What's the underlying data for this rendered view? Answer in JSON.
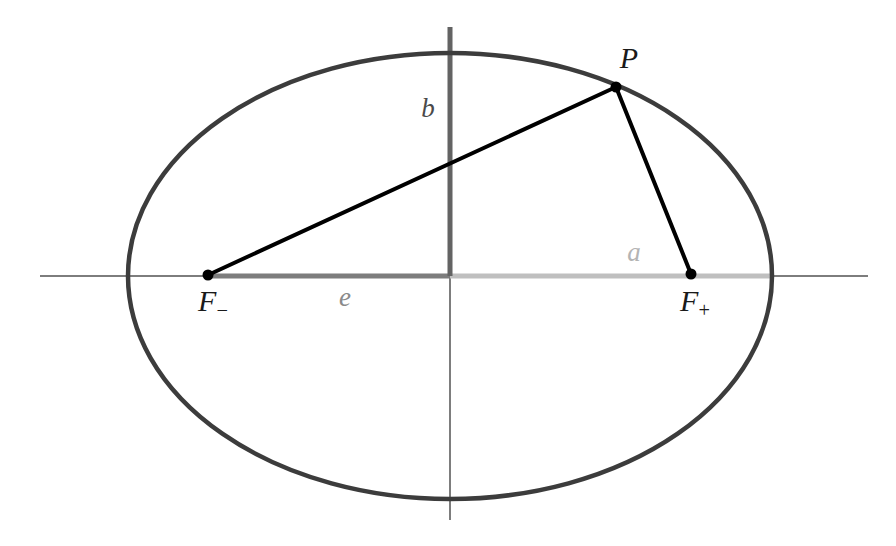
{
  "figure": {
    "width": 896,
    "height": 546,
    "background": "#ffffff"
  },
  "colors": {
    "ellipse_stroke": "#3c3c3c",
    "focal_ray": "#000000",
    "axis_thin": "#7d7d7d",
    "axis_b_segment": "#636363",
    "axis_e_segment": "#7d7d7d",
    "axis_a_segment": "#bfbfbf",
    "point_marker": "#000000",
    "label_dark": "#1a1a1a",
    "label_b": "#4a4a4a",
    "label_e": "#8a8a8a",
    "label_a": "#b4b4b4"
  },
  "geometry": {
    "center": {
      "x": 450,
      "y": 276
    },
    "semi_major_a": 322,
    "semi_minor_b": 223,
    "focal_distance_c": 242,
    "ellipse_stroke_width": 4.5,
    "x_axis": {
      "x1": 40,
      "y1": 276,
      "x2": 868,
      "y2": 276,
      "width": 2
    },
    "y_axis": {
      "x1": 450,
      "y1": 27,
      "x2": 450,
      "y2": 520,
      "width": 2
    },
    "segment_b": {
      "x1": 450,
      "y1": 27,
      "x2": 450,
      "y2": 276,
      "width": 5
    },
    "segment_e": {
      "x1": 208,
      "y1": 276,
      "x2": 450,
      "y2": 276,
      "width": 5
    },
    "segment_a": {
      "x1": 450,
      "y1": 276,
      "x2": 772,
      "y2": 276,
      "width": 5
    },
    "ray_minus": {
      "x1": 208,
      "y1": 275,
      "x2": 616,
      "y2": 87,
      "width": 4
    },
    "ray_plus": {
      "x1": 616,
      "y1": 87,
      "x2": 691,
      "y2": 274,
      "width": 4
    },
    "marker_radius": 5.5
  },
  "points": [
    {
      "key": "P",
      "label": "P",
      "sub": "",
      "x": 616,
      "y": 87,
      "label_x": 629,
      "label_y": 58,
      "style": "label-point"
    },
    {
      "key": "Fminus",
      "label": "F",
      "sub": "−",
      "x": 208,
      "y": 275,
      "label_x": 212,
      "label_y": 303,
      "style": "label-focus"
    },
    {
      "key": "Fplus",
      "label": "F",
      "sub": "+",
      "x": 691,
      "y": 274,
      "label_x": 694,
      "label_y": 303,
      "style": "label-focus"
    }
  ],
  "labels": {
    "point_p": "P",
    "focus_minus_base": "F",
    "focus_minus_sub": "−",
    "focus_plus_base": "F",
    "focus_plus_sub": "+",
    "semi_minor": "b",
    "semi_minor_x": 428,
    "semi_minor_y": 108,
    "eccentric_distance": "e",
    "eccentric_distance_x": 345,
    "eccentric_distance_y": 297,
    "semi_major": "a",
    "semi_major_x": 634,
    "semi_major_y": 252
  }
}
